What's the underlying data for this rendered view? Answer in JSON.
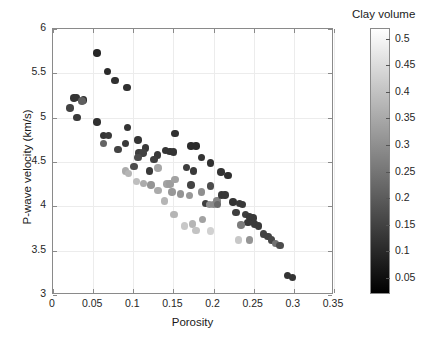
{
  "chart_data": {
    "type": "scatter",
    "title": "",
    "xlabel": "Porosity",
    "ylabel": "P-wave velocity (km/s)",
    "xlim": [
      0,
      0.35
    ],
    "ylim": [
      3,
      6
    ],
    "xticks": [
      "0",
      "0.05",
      "0.1",
      "0.15",
      "0.2",
      "0.25",
      "0.3",
      "0.35"
    ],
    "xtick_values": [
      0,
      0.05,
      0.1,
      0.15,
      0.2,
      0.25,
      0.3,
      0.35
    ],
    "yticks": [
      "3",
      "3.5",
      "4",
      "4.5",
      "5",
      "5.5",
      "6"
    ],
    "ytick_values": [
      3,
      3.5,
      4,
      4.5,
      5,
      5.5,
      6
    ],
    "grid": true,
    "colorbar": {
      "label": "Clay volume",
      "position": "right",
      "colormap": "gray",
      "vmin": 0.02,
      "vmax": 0.52,
      "ticks": [
        "0.05",
        "0.1",
        "0.15",
        "0.2",
        "0.25",
        "0.3",
        "0.35",
        "0.4",
        "0.45",
        "0.5"
      ],
      "tick_values": [
        0.05,
        0.1,
        0.15,
        0.2,
        0.25,
        0.3,
        0.35,
        0.4,
        0.45,
        0.5
      ]
    },
    "marker": "filled-circle",
    "marker_size_px": 7.5,
    "color_variable": "clay_volume",
    "points": [
      {
        "x": 0.055,
        "y": 5.73,
        "c": 0.1
      },
      {
        "x": 0.068,
        "y": 5.52,
        "c": 0.11
      },
      {
        "x": 0.077,
        "y": 5.42,
        "c": 0.12
      },
      {
        "x": 0.092,
        "y": 5.34,
        "c": 0.12
      },
      {
        "x": 0.026,
        "y": 5.22,
        "c": 0.13
      },
      {
        "x": 0.029,
        "y": 5.23,
        "c": 0.13
      },
      {
        "x": 0.038,
        "y": 5.2,
        "c": 0.12
      },
      {
        "x": 0.036,
        "y": 5.19,
        "c": 0.22
      },
      {
        "x": 0.021,
        "y": 5.11,
        "c": 0.16
      },
      {
        "x": 0.03,
        "y": 5.0,
        "c": 0.14
      },
      {
        "x": 0.055,
        "y": 4.95,
        "c": 0.12
      },
      {
        "x": 0.093,
        "y": 4.89,
        "c": 0.13
      },
      {
        "x": 0.063,
        "y": 4.8,
        "c": 0.13
      },
      {
        "x": 0.069,
        "y": 4.8,
        "c": 0.14
      },
      {
        "x": 0.063,
        "y": 4.71,
        "c": 0.23
      },
      {
        "x": 0.09,
        "y": 4.71,
        "c": 0.14
      },
      {
        "x": 0.106,
        "y": 4.75,
        "c": 0.13
      },
      {
        "x": 0.081,
        "y": 4.64,
        "c": 0.16
      },
      {
        "x": 0.152,
        "y": 4.82,
        "c": 0.12
      },
      {
        "x": 0.146,
        "y": 4.62,
        "c": 0.13
      },
      {
        "x": 0.15,
        "y": 4.61,
        "c": 0.13
      },
      {
        "x": 0.172,
        "y": 4.68,
        "c": 0.11
      },
      {
        "x": 0.178,
        "y": 4.68,
        "c": 0.11
      },
      {
        "x": 0.115,
        "y": 4.66,
        "c": 0.14
      },
      {
        "x": 0.107,
        "y": 4.6,
        "c": 0.15
      },
      {
        "x": 0.112,
        "y": 4.6,
        "c": 0.16
      },
      {
        "x": 0.106,
        "y": 4.55,
        "c": 0.18
      },
      {
        "x": 0.13,
        "y": 4.58,
        "c": 0.14
      },
      {
        "x": 0.14,
        "y": 4.63,
        "c": 0.13
      },
      {
        "x": 0.126,
        "y": 4.53,
        "c": 0.15
      },
      {
        "x": 0.185,
        "y": 4.55,
        "c": 0.13
      },
      {
        "x": 0.196,
        "y": 4.49,
        "c": 0.12
      },
      {
        "x": 0.166,
        "y": 4.44,
        "c": 0.15
      },
      {
        "x": 0.09,
        "y": 4.4,
        "c": 0.38
      },
      {
        "x": 0.094,
        "y": 4.37,
        "c": 0.4
      },
      {
        "x": 0.104,
        "y": 4.28,
        "c": 0.42
      },
      {
        "x": 0.113,
        "y": 4.26,
        "c": 0.38
      },
      {
        "x": 0.122,
        "y": 4.24,
        "c": 0.33
      },
      {
        "x": 0.131,
        "y": 4.43,
        "c": 0.37
      },
      {
        "x": 0.131,
        "y": 4.18,
        "c": 0.38
      },
      {
        "x": 0.142,
        "y": 4.25,
        "c": 0.36
      },
      {
        "x": 0.146,
        "y": 4.25,
        "c": 0.35
      },
      {
        "x": 0.148,
        "y": 4.16,
        "c": 0.34
      },
      {
        "x": 0.159,
        "y": 4.14,
        "c": 0.33
      },
      {
        "x": 0.139,
        "y": 4.06,
        "c": 0.4
      },
      {
        "x": 0.152,
        "y": 4.3,
        "c": 0.36
      },
      {
        "x": 0.172,
        "y": 4.24,
        "c": 0.16
      },
      {
        "x": 0.17,
        "y": 4.12,
        "c": 0.34
      },
      {
        "x": 0.185,
        "y": 4.16,
        "c": 0.32
      },
      {
        "x": 0.19,
        "y": 4.03,
        "c": 0.15
      },
      {
        "x": 0.195,
        "y": 4.02,
        "c": 0.32
      },
      {
        "x": 0.2,
        "y": 4.02,
        "c": 0.31
      },
      {
        "x": 0.204,
        "y": 4.06,
        "c": 0.3
      },
      {
        "x": 0.151,
        "y": 3.91,
        "c": 0.4
      },
      {
        "x": 0.164,
        "y": 3.78,
        "c": 0.44
      },
      {
        "x": 0.174,
        "y": 3.8,
        "c": 0.4
      },
      {
        "x": 0.178,
        "y": 3.73,
        "c": 0.43
      },
      {
        "x": 0.186,
        "y": 3.85,
        "c": 0.36
      },
      {
        "x": 0.196,
        "y": 3.72,
        "c": 0.46
      },
      {
        "x": 0.205,
        "y": 4.02,
        "c": 0.24
      },
      {
        "x": 0.196,
        "y": 4.23,
        "c": 0.18
      },
      {
        "x": 0.209,
        "y": 4.39,
        "c": 0.13
      },
      {
        "x": 0.218,
        "y": 4.35,
        "c": 0.12
      },
      {
        "x": 0.21,
        "y": 4.13,
        "c": 0.14
      },
      {
        "x": 0.214,
        "y": 4.13,
        "c": 0.14
      },
      {
        "x": 0.224,
        "y": 4.05,
        "c": 0.13
      },
      {
        "x": 0.232,
        "y": 4.03,
        "c": 0.14
      },
      {
        "x": 0.236,
        "y": 4.02,
        "c": 0.14
      },
      {
        "x": 0.228,
        "y": 3.93,
        "c": 0.15
      },
      {
        "x": 0.24,
        "y": 3.91,
        "c": 0.15
      },
      {
        "x": 0.245,
        "y": 3.88,
        "c": 0.14
      },
      {
        "x": 0.249,
        "y": 3.87,
        "c": 0.14
      },
      {
        "x": 0.243,
        "y": 3.82,
        "c": 0.14
      },
      {
        "x": 0.251,
        "y": 3.8,
        "c": 0.14
      },
      {
        "x": 0.256,
        "y": 3.78,
        "c": 0.14
      },
      {
        "x": 0.234,
        "y": 3.79,
        "c": 0.28
      },
      {
        "x": 0.231,
        "y": 3.62,
        "c": 0.44
      },
      {
        "x": 0.245,
        "y": 3.62,
        "c": 0.33
      },
      {
        "x": 0.262,
        "y": 3.69,
        "c": 0.16
      },
      {
        "x": 0.268,
        "y": 3.66,
        "c": 0.16
      },
      {
        "x": 0.272,
        "y": 3.62,
        "c": 0.17
      },
      {
        "x": 0.277,
        "y": 3.58,
        "c": 0.26
      },
      {
        "x": 0.283,
        "y": 3.56,
        "c": 0.18
      },
      {
        "x": 0.292,
        "y": 3.22,
        "c": 0.13
      },
      {
        "x": 0.298,
        "y": 3.2,
        "c": 0.13
      },
      {
        "x": 0.175,
        "y": 4.4,
        "c": 0.14
      },
      {
        "x": 0.12,
        "y": 4.4,
        "c": 0.14
      },
      {
        "x": 0.101,
        "y": 4.45,
        "c": 0.18
      }
    ]
  }
}
